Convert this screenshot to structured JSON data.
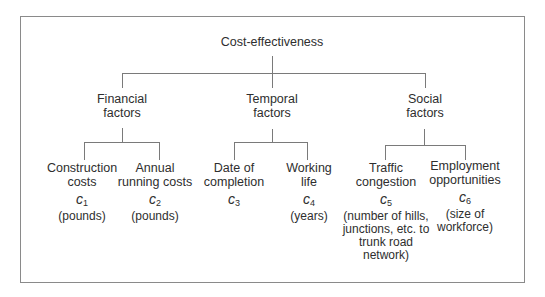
{
  "diagram": {
    "root": {
      "label": "Cost-effectiveness"
    },
    "categories": [
      {
        "line1": "Financial",
        "line2": "factors",
        "criteria": [
          {
            "line1": "Construction",
            "line2": "costs",
            "symbol": "c",
            "index": "1",
            "unit": [
              "(pounds)"
            ]
          },
          {
            "line1": "Annual",
            "line2": "running costs",
            "symbol": "c",
            "index": "2",
            "unit": [
              "(pounds)"
            ]
          }
        ]
      },
      {
        "line1": "Temporal",
        "line2": "factors",
        "criteria": [
          {
            "line1": "Date of",
            "line2": "completion",
            "symbol": "c",
            "index": "3",
            "unit": []
          },
          {
            "line1": "Working",
            "line2": "life",
            "symbol": "c",
            "index": "4",
            "unit": [
              "(years)"
            ]
          }
        ]
      },
      {
        "line1": "Social",
        "line2": "factors",
        "criteria": [
          {
            "line1": "Traffic",
            "line2": "congestion",
            "symbol": "c",
            "index": "5",
            "unit": [
              "(number of hills,",
              "junctions, etc. to",
              "trunk road",
              "network)"
            ]
          },
          {
            "line1": "Employment",
            "line2": "opportunities",
            "symbol": "c",
            "index": "6",
            "unit": [
              "(size of",
              "workforce)"
            ]
          }
        ]
      }
    ],
    "colors": {
      "text": "#2e2e2e",
      "lines": "#7a7a7a",
      "border": "#8a8a8a"
    }
  }
}
